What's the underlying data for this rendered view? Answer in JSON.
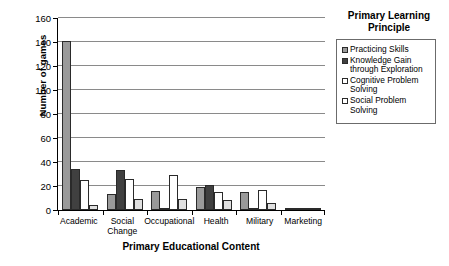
{
  "chart_data": {
    "type": "bar",
    "title": "",
    "xlabel": "Primary Educational Content",
    "ylabel": "Number of games",
    "ylim": [
      0,
      160
    ],
    "ytick_step": 20,
    "yticks": [
      0,
      20,
      40,
      60,
      80,
      100,
      120,
      140,
      160
    ],
    "grid": true,
    "legend_position": "right",
    "legend_title": "Primary Learning Principle",
    "categories": [
      "Academic",
      "Social Change",
      "Occupational",
      "Health",
      "Military",
      "Marketing"
    ],
    "series": [
      {
        "name": "Practicing Skills",
        "color": "#9a9a9a",
        "values": [
          140,
          13,
          16,
          19,
          15,
          2
        ]
      },
      {
        "name": "Knowledge Gain through Exploration",
        "color": "#404040",
        "values": [
          34,
          33,
          2,
          21,
          1,
          2
        ]
      },
      {
        "name": "Cognitive Problem Solving",
        "color": "#ffffff",
        "values": [
          25,
          26,
          29,
          15,
          17,
          1
        ]
      },
      {
        "name": "Social Problem Solving",
        "color": "#e0e0e0",
        "values": [
          4,
          9,
          9,
          8,
          6,
          1
        ]
      }
    ]
  },
  "legend": {
    "title_line1": "Primary Learning",
    "title_line2": "Principle",
    "items": [
      {
        "label": "Practicing Skills",
        "swatch": "#9a9a9a"
      },
      {
        "label": "Knowledge Gain through Exploration",
        "swatch": "#404040"
      },
      {
        "label": "Cognitive Problem Solving",
        "swatch": "#ffffff"
      },
      {
        "label": "Social Problem Solving",
        "swatch": "#ffffff"
      }
    ]
  }
}
